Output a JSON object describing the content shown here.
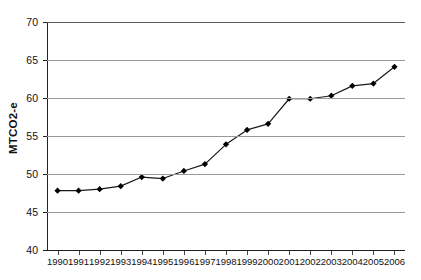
{
  "chart_data": {
    "type": "line",
    "title": "",
    "xlabel": "",
    "ylabel": "MTCO2-e",
    "ylim": [
      40,
      70
    ],
    "ytick_step": 5,
    "yticks": [
      70,
      65,
      60,
      55,
      50,
      45,
      40
    ],
    "ytick_labels": [
      "70",
      "65",
      "60",
      "55",
      "50",
      "45",
      "40"
    ],
    "grid": true,
    "legend": null,
    "categories": [
      "1990",
      "1991",
      "1992",
      "1993",
      "1994",
      "1995",
      "1996",
      "1997",
      "1998",
      "1999",
      "2000",
      "2001",
      "2002",
      "2003",
      "2004",
      "2005",
      "2006"
    ],
    "x": [
      1990,
      1991,
      1992,
      1993,
      1994,
      1995,
      1996,
      1997,
      1998,
      1999,
      2000,
      2001,
      2002,
      2003,
      2004,
      2005,
      2006
    ],
    "values": [
      47.8,
      47.8,
      48.0,
      48.4,
      49.6,
      49.4,
      50.4,
      51.3,
      53.9,
      55.8,
      56.6,
      59.9,
      59.9,
      60.3,
      61.6,
      61.9,
      64.1
    ],
    "series": [
      {
        "name": "MTCO2-e",
        "values": [
          47.8,
          47.8,
          48.0,
          48.4,
          49.6,
          49.4,
          50.4,
          51.3,
          53.9,
          55.8,
          56.6,
          59.9,
          59.9,
          60.3,
          61.6,
          61.9,
          64.1
        ]
      }
    ],
    "colors": {
      "line": "#1a1a1a",
      "marker": "#000000",
      "grid": "#9a9a9a",
      "axis": "#222222",
      "background": "#ffffff"
    },
    "marker": "diamond",
    "marker_size": 3.1,
    "line_width": 1.2
  }
}
